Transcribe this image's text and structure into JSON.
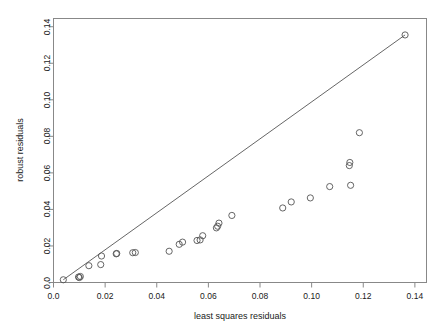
{
  "chart_data": {
    "type": "scatter",
    "title": "",
    "xlabel": "least squares residuals",
    "ylabel": "robust residuals",
    "xlim": [
      0.0,
      0.1445
    ],
    "ylim": [
      0.0,
      0.1445
    ],
    "xticks": [
      0.0,
      0.02,
      0.04,
      0.06,
      0.08,
      0.1,
      0.12,
      0.14
    ],
    "yticks": [
      0.0,
      0.02,
      0.04,
      0.06,
      0.08,
      0.1,
      0.12,
      0.14
    ],
    "xticklabels": [
      "0.0",
      "0.02",
      "0.04",
      "0.06",
      "0.08",
      "0.10",
      "0.12",
      "0.14"
    ],
    "yticklabels": [
      "0.0",
      "0.02",
      "0.04",
      "0.06",
      "0.08",
      "0.10",
      "0.12",
      "0.14"
    ],
    "grid": false,
    "legend": null,
    "box": true,
    "point_marker": "open-circle",
    "point_color": "#555555",
    "line_color": "#555555",
    "reference_line": {
      "label": "",
      "x": [
        0.0038,
        0.1362
      ],
      "y": [
        0.0015,
        0.1355
      ]
    },
    "x": [
      0.0038,
      0.0097,
      0.01,
      0.0104,
      0.0137,
      0.0183,
      0.0186,
      0.0243,
      0.0245,
      0.0307,
      0.0317,
      0.0448,
      0.0487,
      0.05,
      0.0556,
      0.0568,
      0.0578,
      0.0631,
      0.0636,
      0.0641,
      0.0691,
      0.0888,
      0.0921,
      0.0995,
      0.107,
      0.1146,
      0.1148,
      0.1151,
      0.1185,
      0.1362
    ],
    "y": [
      0.0015,
      0.003,
      0.0027,
      0.0033,
      0.0092,
      0.0098,
      0.0145,
      0.0157,
      0.0159,
      0.0163,
      0.0164,
      0.0171,
      0.0209,
      0.0221,
      0.023,
      0.0233,
      0.0256,
      0.0299,
      0.0308,
      0.0325,
      0.0367,
      0.0408,
      0.0441,
      0.0463,
      0.0525,
      0.064,
      0.0657,
      0.0532,
      0.082,
      0.1355
    ],
    "n_points": 30
  }
}
